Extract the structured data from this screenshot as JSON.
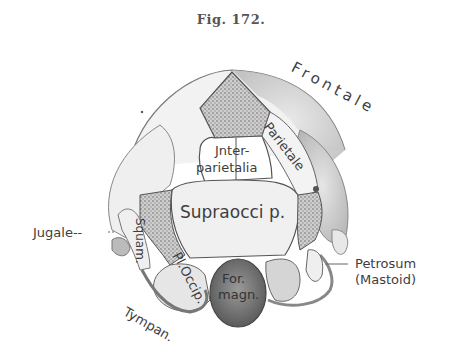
{
  "figure": {
    "caption": "Fig. 172.",
    "labels": {
      "frontale": "Frontale",
      "parietale": "Parietale",
      "interparietalia_1": "Jnter-",
      "interparietalia_2": "parietalia",
      "supraoccip": "Supraocci p.",
      "jugale": "Jugale--",
      "squam": "Squam.",
      "pl_occip": "Pl.Occip.",
      "for_magn_1": "For.",
      "for_magn_2": "magn.",
      "petrosum": "Petrosum",
      "mastoid": "(Mastoid)",
      "tympan": "Tympan."
    }
  }
}
